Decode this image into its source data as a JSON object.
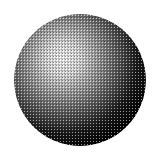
{
  "image": {
    "subject": "halftone-shaded-sphere",
    "background": "#ffffff",
    "sphere": {
      "cx": 80,
      "cy": 80,
      "r": 66,
      "highlight_cx": "37%",
      "highlight_cy": "34%",
      "colors": {
        "highlight": "#ffffff",
        "light": "#c8c8c8",
        "mid": "#7a7a7a",
        "dark": "#262626",
        "shadow": "#000000"
      }
    },
    "halftone": {
      "cell_size": 3,
      "dot_color": "#000000",
      "gap_color": "#ffffff"
    }
  }
}
